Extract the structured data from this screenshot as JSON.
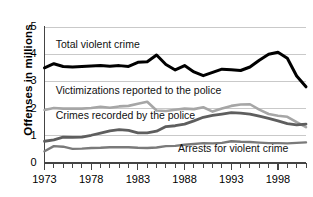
{
  "chart_data": {
    "type": "line",
    "title": "",
    "xlabel": "",
    "ylabel": "Offenses in millions",
    "xlim": [
      1973,
      2001
    ],
    "ylim": [
      0,
      5
    ],
    "yticks": [
      0,
      1,
      2,
      3,
      4,
      5
    ],
    "ytick_labels": [
      "0",
      "1",
      "2",
      "3",
      "4",
      "5"
    ],
    "xticks": [
      1973,
      1978,
      1983,
      1988,
      1993,
      1998
    ],
    "xtick_labels": [
      "1973",
      "1978",
      "1983",
      "1988",
      "1993",
      "1998"
    ],
    "x_minor_tick_interval": 1,
    "grid": "horizontal",
    "legend": "inline-annotations",
    "x": [
      1973,
      1974,
      1975,
      1976,
      1977,
      1978,
      1979,
      1980,
      1981,
      1982,
      1983,
      1984,
      1985,
      1986,
      1987,
      1988,
      1989,
      1990,
      1991,
      1992,
      1993,
      1994,
      1995,
      1996,
      1997,
      1998,
      1999,
      2000,
      2001
    ],
    "series": [
      {
        "name": "Total violent crime",
        "color": "#000000",
        "width": 3.0,
        "values": [
          3.5,
          3.65,
          3.55,
          3.53,
          3.55,
          3.57,
          3.58,
          3.56,
          3.58,
          3.55,
          3.7,
          3.72,
          3.97,
          3.62,
          3.42,
          3.58,
          3.35,
          3.21,
          3.33,
          3.45,
          3.43,
          3.4,
          3.53,
          3.78,
          4.0,
          4.07,
          3.85,
          3.2,
          2.8
        ]
      },
      {
        "name": "Victimizations reported to the police",
        "color": "#a6a6a6",
        "width": 2.6,
        "values": [
          1.95,
          2.02,
          2.0,
          2.0,
          2.0,
          2.02,
          2.07,
          2.03,
          2.08,
          2.1,
          2.18,
          2.25,
          1.93,
          1.91,
          1.96,
          2.0,
          1.98,
          2.05,
          1.89,
          2.0,
          2.1,
          2.15,
          2.16,
          1.96,
          1.8,
          1.74,
          1.7,
          1.5,
          1.32
        ]
      },
      {
        "name": "Crimes recorded by the police",
        "color": "#5e5e5e",
        "width": 2.8,
        "values": [
          0.8,
          0.85,
          0.95,
          0.94,
          0.95,
          1.02,
          1.1,
          1.18,
          1.23,
          1.2,
          1.11,
          1.11,
          1.17,
          1.34,
          1.37,
          1.43,
          1.55,
          1.68,
          1.75,
          1.8,
          1.85,
          1.83,
          1.8,
          1.72,
          1.64,
          1.55,
          1.45,
          1.4,
          1.43
        ]
      },
      {
        "name": "Arrests for violent crime",
        "color": "#7a7a7a",
        "width": 2.4,
        "values": [
          0.43,
          0.62,
          0.6,
          0.52,
          0.53,
          0.55,
          0.56,
          0.58,
          0.58,
          0.58,
          0.56,
          0.55,
          0.57,
          0.62,
          0.63,
          0.67,
          0.7,
          0.73,
          0.72,
          0.74,
          0.8,
          0.78,
          0.77,
          0.75,
          0.73,
          0.73,
          0.72,
          0.74,
          0.76
        ]
      }
    ],
    "annotations": [
      {
        "text": "Total violent crime",
        "x": 1974.2,
        "y": 4.35
      },
      {
        "text": "Victimizations reported to the police",
        "x": 1974.2,
        "y": 2.63
      },
      {
        "text": "Crimes recorded by the police",
        "x": 1974.2,
        "y": 1.72
      },
      {
        "text": "Arrests for violent crime",
        "x": 1987.3,
        "y": 0.52
      }
    ]
  },
  "style": {
    "grid_color": "#c9c9c9",
    "axis_color": "#444444",
    "background": "#ffffff"
  }
}
